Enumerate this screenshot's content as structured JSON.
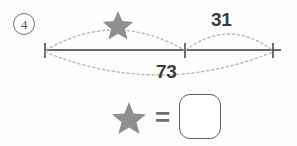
{
  "problem": {
    "number_label": "4",
    "number_icon": "circled-number-icon"
  },
  "number_line": {
    "line_color": "#6b6b6b",
    "tick_color": "#4a4a4a",
    "arc_color": "#b0b0b0",
    "ticks": [
      {
        "name": "left-endpoint",
        "x": 45
      },
      {
        "name": "middle-point",
        "x": 185
      },
      {
        "name": "right-endpoint",
        "x": 273
      }
    ],
    "jumps": [
      {
        "name": "unknown-jump",
        "label": "star",
        "label_type": "star-icon",
        "from": "left-endpoint",
        "to": "middle-point",
        "position": "above"
      },
      {
        "name": "known-jump",
        "label": "31",
        "label_type": "number",
        "from": "middle-point",
        "to": "right-endpoint",
        "position": "above"
      },
      {
        "name": "total-jump",
        "label": "73",
        "label_type": "number",
        "from": "left-endpoint",
        "to": "right-endpoint",
        "position": "below"
      }
    ]
  },
  "answer": {
    "star_icon": "star-icon",
    "equals": "=",
    "box_value": "",
    "box_placeholder": ""
  },
  "colors": {
    "star": "#8f8f8f",
    "text": "#3b3b3b",
    "line": "#6b6b6b",
    "dotted": "#b0b0b0",
    "box_border": "#5f5f5f",
    "background": "#fdfdfd"
  }
}
